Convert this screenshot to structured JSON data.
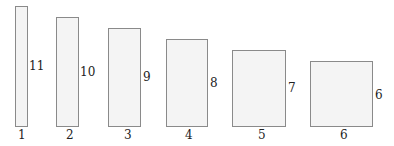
{
  "rectangles": [
    {
      "index": "1",
      "side_label": "11",
      "x": 15,
      "w": 12,
      "top": 6
    },
    {
      "index": "2",
      "side_label": "10",
      "x": 56,
      "w": 22,
      "top": 17
    },
    {
      "index": "3",
      "side_label": "9",
      "x": 108,
      "w": 32,
      "top": 28
    },
    {
      "index": "4",
      "side_label": "8",
      "x": 166,
      "w": 42,
      "top": 39
    },
    {
      "index": "5",
      "side_label": "7",
      "x": 232,
      "w": 54,
      "top": 50
    },
    {
      "index": "6",
      "side_label": "6",
      "x": 310,
      "w": 63,
      "top": 61
    }
  ],
  "baseline": 126,
  "colors": {
    "fill": "#f4f4f4",
    "stroke": "#8a8a8a",
    "text": "#222222"
  }
}
